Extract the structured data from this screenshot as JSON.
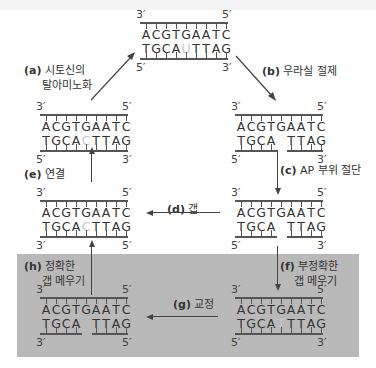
{
  "strands": {
    "top": {
      "left_top": "3′",
      "right_top": "5′",
      "left_bottom": "5′",
      "right_bottom": "3′",
      "upper": "ACGTGAATC",
      "lower": [
        "T",
        "G",
        "C",
        "A",
        "U",
        "T",
        "T",
        "A",
        "G"
      ],
      "pale_index": 4
    },
    "a": {
      "left_top": "3′",
      "right_top": "5′",
      "left_bottom": "5′",
      "right_bottom": "3′",
      "upper": "ACGTGAATC",
      "lower": [
        "T",
        "G",
        "C",
        "A",
        "C",
        "T",
        "T",
        "A",
        "G"
      ],
      "pale_index": 4
    },
    "b": {
      "left_top": "3′",
      "right_top": "5′",
      "left_bottom": "5′",
      "right_bottom": "3′",
      "upper": "ACGTGAATC",
      "lower": [
        "T",
        "G",
        "C",
        "A",
        " ",
        "T",
        "T",
        "A",
        "G"
      ],
      "pale_index": -1
    },
    "e": {
      "left_top": "3′",
      "right_top": "5′",
      "left_bottom": "3′",
      "right_bottom": "5′",
      "upper": "ACGTGAATC",
      "lower": [
        "T",
        "G",
        "C",
        "A",
        "C",
        "T",
        "T",
        "A",
        "G"
      ],
      "pale_index": 4
    },
    "c": {
      "left_top": "3′",
      "right_top": "5′",
      "left_bottom": "5′",
      "right_bottom": "3′",
      "upper": "ACGTGAATC",
      "lower": [
        "T",
        "G",
        "C",
        "A",
        " ",
        "T",
        "T",
        "A",
        "G"
      ],
      "pale_index": -1
    },
    "h": {
      "left_top": "3′",
      "right_top": "5′",
      "left_bottom": "3′",
      "right_bottom": "5′",
      "upper": "ACGTGAATC",
      "lower": [
        "T",
        "G",
        "C",
        "A",
        " ",
        "T",
        "T",
        "A",
        "G"
      ],
      "pale_index": -1
    },
    "f": {
      "left_top": "3′",
      "right_top": "5′",
      "left_bottom": "5′",
      "right_bottom": "3′",
      "upper": "ACGTGAATC",
      "lower": [
        "T",
        "G",
        "C",
        "A",
        "T",
        "T",
        "T",
        "A",
        "G"
      ],
      "pale_index": 4
    }
  },
  "steps": {
    "a": {
      "tag": "(a)",
      "text1": "시토신의",
      "text2": "탈아미노화"
    },
    "b": {
      "tag": "(b)",
      "text1": "우라실 절제"
    },
    "c": {
      "tag": "(c)",
      "text1": "AP 부위 절단"
    },
    "d": {
      "tag": "(d)",
      "text1": "갭"
    },
    "e": {
      "tag": "(e)",
      "text1": "연결"
    },
    "f": {
      "tag": "(f)",
      "text1": "부정확한",
      "text2": "갭 메우기"
    },
    "g": {
      "tag": "(g)",
      "text1": "교정"
    },
    "h": {
      "tag": "(h)",
      "text1": "정확한",
      "text2": "갭 메우기"
    }
  },
  "colors": {
    "panel": "#b9b9b9",
    "pale_base": "#c8c8c8",
    "ink": "#333333"
  }
}
